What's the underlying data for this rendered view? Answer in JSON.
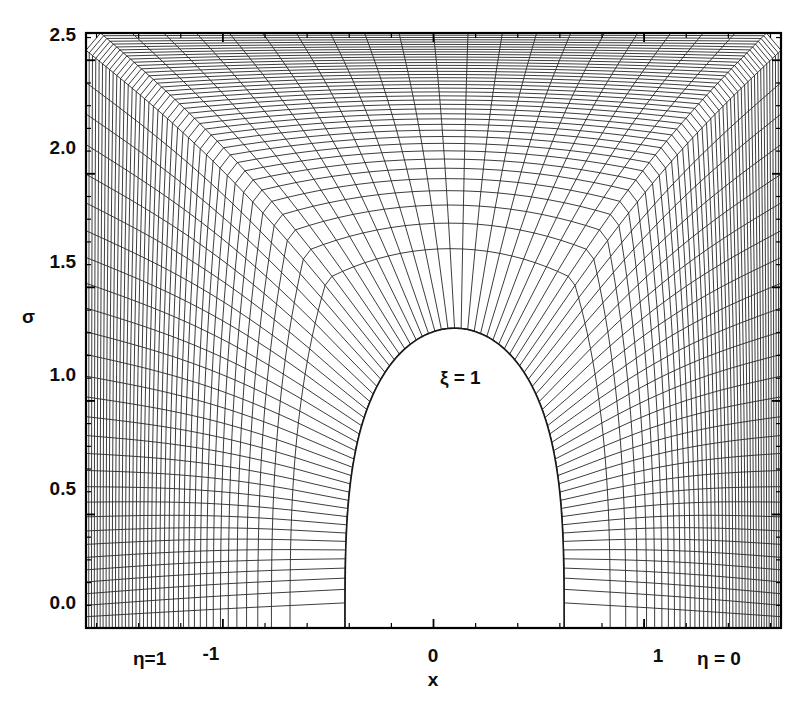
{
  "figure": {
    "type": "computational-grid-plot",
    "background_color": "#ffffff",
    "line_color": "#1a1a1a",
    "frame_color": "#000000"
  },
  "axes": {
    "x": {
      "label": "x",
      "ticks": [
        {
          "value": -1,
          "label": "-1"
        },
        {
          "value": 0,
          "label": "0"
        },
        {
          "value": 1,
          "label": "1"
        }
      ],
      "minor_tick_count": 5,
      "range": [
        -1.65,
        1.65
      ]
    },
    "y": {
      "label": "σ",
      "ticks": [
        {
          "value": 0.0,
          "label": "0.0"
        },
        {
          "value": 0.5,
          "label": "0.5"
        },
        {
          "value": 1.0,
          "label": "1.0"
        },
        {
          "value": 1.5,
          "label": "1.5"
        },
        {
          "value": 2.0,
          "label": "2.0"
        },
        {
          "value": 2.5,
          "label": "2.5"
        }
      ],
      "minor_tick_count": 5,
      "range": [
        0.0,
        2.62
      ]
    }
  },
  "annotations": [
    {
      "name": "xi-body-label",
      "text": "ξ = 1"
    },
    {
      "name": "eta-left-label",
      "text": "η=1"
    },
    {
      "name": "eta-right-label",
      "text": "η = 0"
    }
  ],
  "chart_data": {
    "type": "line",
    "title": "",
    "xlabel": "x",
    "ylabel": "σ",
    "xlim": [
      -1.65,
      1.65
    ],
    "ylim": [
      0.0,
      2.62
    ],
    "xticks": [
      -1,
      0,
      1
    ],
    "xticklabels": [
      "-1",
      "0",
      "1"
    ],
    "yticks": [
      0.0,
      0.5,
      1.0,
      1.5,
      2.0,
      2.5
    ],
    "yticklabels": [
      "0.0",
      "0.5",
      "1.0",
      "1.5",
      "2.0",
      "2.5"
    ],
    "grid": false,
    "legend": null,
    "annotations": [
      {
        "text": "ξ = 1",
        "x": 0.07,
        "y": 1.18
      },
      {
        "text": "η=1",
        "x": -1.36,
        "y": -0.17
      },
      {
        "text": "-1",
        "x": -1.0,
        "y": -0.13
      },
      {
        "text": "0",
        "x": 0.0,
        "y": -0.13
      },
      {
        "text": "1",
        "x": 1.0,
        "y": -0.13
      },
      {
        "text": "η = 0",
        "x": 1.35,
        "y": -0.17
      }
    ],
    "mesh": {
      "family_xi_count": 41,
      "family_eta_count": 81,
      "inner_boundary_name": "body surface (ξ = 1)",
      "outer_boundary_name": "outer domain boundary",
      "eta_runs_from": 1,
      "eta_runs_to": 0,
      "body_nose_x": 0.0,
      "body_nose_sigma": 1.32,
      "body_base_left_x": -0.42,
      "body_base_right_x": 0.62,
      "clustering": "dense near body surface, coarsening outward"
    }
  }
}
